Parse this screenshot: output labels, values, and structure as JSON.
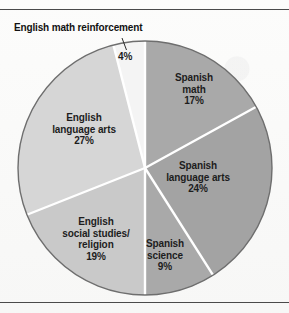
{
  "chart_data": {
    "type": "pie",
    "title": "",
    "xlabel": "",
    "ylabel": "",
    "legend_position": "none",
    "grid": false,
    "units": "percent",
    "start_angle_deg": 0,
    "direction": "clockwise",
    "categories": [
      "Spanish math",
      "Spanish language arts",
      "Spanish science",
      "English social studies/religion",
      "English language arts",
      "English math reinforcement"
    ],
    "values": [
      17,
      24,
      9,
      19,
      27,
      4
    ],
    "slices": [
      {
        "name": "spanish-math",
        "label_line1": "Spanish",
        "label_line2": "math",
        "value": 17,
        "value_label": "17%",
        "color": "#a9a9a9",
        "label_placement": "inside"
      },
      {
        "name": "spanish-language-arts",
        "label_line1": "Spanish",
        "label_line2": "language arts",
        "value": 24,
        "value_label": "24%",
        "color": "#a3a3a3",
        "label_placement": "inside"
      },
      {
        "name": "spanish-science",
        "label_line1": "Spanish",
        "label_line2": "science",
        "value": 9,
        "value_label": "9%",
        "color": "#a9a9a9",
        "label_placement": "inside"
      },
      {
        "name": "english-social-studies-religion",
        "label_line1": "English",
        "label_line2": "social studies/",
        "label_line3": "religion",
        "value": 19,
        "value_label": "19%",
        "color": "#c9c9c9",
        "label_placement": "inside"
      },
      {
        "name": "english-language-arts",
        "label_line1": "English",
        "label_line2": "language arts",
        "value": 27,
        "value_label": "27%",
        "color": "#d6d6d6",
        "label_placement": "inside"
      },
      {
        "name": "english-math-reinforcement",
        "label_line1": "English math reinforcement",
        "value": 4,
        "value_label": "4%",
        "color": "#f4f4f4",
        "label_placement": "callout"
      }
    ],
    "separator_color": "#ffffff",
    "outline_color": "#6e6e6e",
    "background_color": "#fbfbfa",
    "text_color": "#1d1d1d"
  }
}
